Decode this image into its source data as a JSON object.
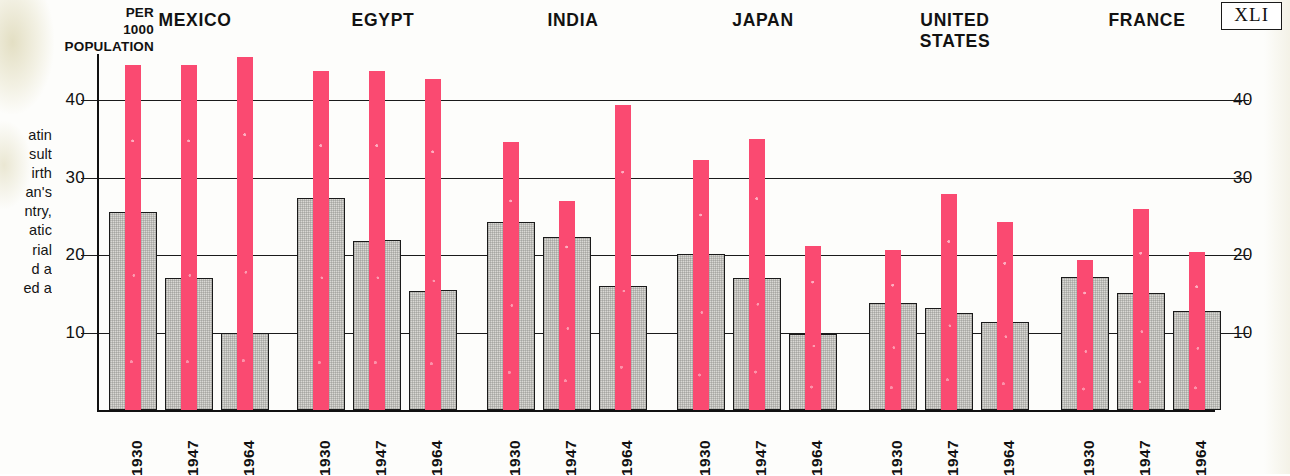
{
  "folio": {
    "label": "XLI"
  },
  "axis_caption": {
    "line1": "PER",
    "line2": "1000",
    "line3": "POPULATION"
  },
  "body_copy": {
    "lines": [
      "atin",
      "sult",
      "irth",
      "an's",
      "ntry,",
      "atic",
      "rial",
      "d  a",
      "ed a"
    ]
  },
  "colors": {
    "pink": "#fa4a71",
    "gray_fill": "#d9d8d4",
    "ink": "#1a1a1a",
    "paper": "#fdfdfb"
  },
  "chart_data": {
    "type": "bar",
    "title": "",
    "xlabel": "",
    "ylabel": "PER 1000 POPULATION",
    "ylim": [
      0,
      46
    ],
    "yticks": [
      10,
      20,
      30,
      40
    ],
    "ytick_labels_left": [
      "40",
      "30",
      "20",
      "10"
    ],
    "ytick_labels_right": [
      "40",
      "30",
      "20",
      "10"
    ],
    "grid": true,
    "legend": "none",
    "categories": [
      "1930",
      "1947",
      "1964"
    ],
    "series": [
      {
        "name": "gray-left",
        "color": "#d9d8d4"
      },
      {
        "name": "pink",
        "color": "#fa4a71"
      },
      {
        "name": "gray-right",
        "color": "#d9d8d4"
      }
    ],
    "groups": [
      {
        "name": "MEXICO",
        "title_lines": [
          "MEXICO"
        ],
        "years": [
          {
            "year": "1930",
            "gray_left": 25.5,
            "pink": 44.5,
            "gray_right": 25.5
          },
          {
            "year": "1947",
            "gray_left": 17.0,
            "pink": 44.5,
            "gray_right": 17.0
          },
          {
            "year": "1964",
            "gray_left": 10.0,
            "pink": 45.5,
            "gray_right": 10.0
          }
        ]
      },
      {
        "name": "EGYPT",
        "title_lines": [
          "EGYPT"
        ],
        "years": [
          {
            "year": "1930",
            "gray_left": 27.4,
            "pink": 43.7,
            "gray_right": 27.4
          },
          {
            "year": "1947",
            "gray_left": 21.8,
            "pink": 43.7,
            "gray_right": 22.0
          },
          {
            "year": "1964",
            "gray_left": 15.4,
            "pink": 42.7,
            "gray_right": 15.5
          }
        ]
      },
      {
        "name": "INDIA",
        "title_lines": [
          "INDIA"
        ],
        "years": [
          {
            "year": "1930",
            "gray_left": 24.3,
            "pink": 34.6,
            "gray_right": 24.3
          },
          {
            "year": "1947",
            "gray_left": 22.3,
            "pink": 27.0,
            "gray_right": 22.3
          },
          {
            "year": "1964",
            "gray_left": 16.0,
            "pink": 39.3,
            "gray_right": 16.0
          }
        ]
      },
      {
        "name": "JAPAN",
        "title_lines": [
          "JAPAN"
        ],
        "years": [
          {
            "year": "1930",
            "gray_left": 20.1,
            "pink": 32.3,
            "gray_right": 20.1
          },
          {
            "year": "1947",
            "gray_left": 17.0,
            "pink": 35.0,
            "gray_right": 17.0
          },
          {
            "year": "1964",
            "gray_left": 9.8,
            "pink": 21.2,
            "gray_right": 9.8
          }
        ]
      },
      {
        "name": "UNITED STATES",
        "title_lines": [
          "UNITED",
          "STATES"
        ],
        "years": [
          {
            "year": "1930",
            "gray_left": 13.8,
            "pink": 20.6,
            "gray_right": 13.8
          },
          {
            "year": "1947",
            "gray_left": 13.1,
            "pink": 27.9,
            "gray_right": 12.5
          },
          {
            "year": "1964",
            "gray_left": 11.4,
            "pink": 24.3,
            "gray_right": 11.4
          }
        ]
      },
      {
        "name": "FRANCE",
        "title_lines": [
          "FRANCE"
        ],
        "years": [
          {
            "year": "1930",
            "gray_left": 17.2,
            "pink": 19.4,
            "gray_right": 17.2
          },
          {
            "year": "1947",
            "gray_left": 15.1,
            "pink": 25.9,
            "gray_right": 15.1
          },
          {
            "year": "1964",
            "gray_left": 12.8,
            "pink": 20.4,
            "gray_right": 12.8
          }
        ]
      }
    ]
  }
}
